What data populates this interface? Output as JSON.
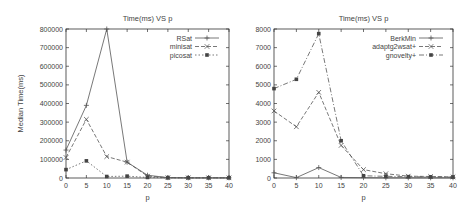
{
  "chart_data": [
    {
      "type": "line",
      "title": "Time(ms) VS p",
      "xlabel": "p",
      "ylabel": "Median Time(ms)",
      "x": [
        0,
        5,
        10,
        15,
        20,
        25,
        30,
        35,
        40
      ],
      "xticks": [
        0,
        5,
        10,
        15,
        20,
        25,
        30,
        35,
        40
      ],
      "yticks": [
        0,
        100000,
        200000,
        300000,
        400000,
        500000,
        600000,
        700000,
        800000
      ],
      "xlim": [
        0,
        40
      ],
      "ylim": [
        0,
        800000
      ],
      "grid": false,
      "legend_position": "top-right",
      "series": [
        {
          "name": "RSat",
          "marker": "+",
          "dash": "solid",
          "values": [
            150000,
            390000,
            800000,
            85000,
            15000,
            2000,
            1000,
            1000,
            1000
          ]
        },
        {
          "name": "minisat",
          "marker": "x",
          "dash": "dashed",
          "values": [
            110000,
            315000,
            115000,
            85000,
            10000,
            2000,
            1000,
            1000,
            1000
          ]
        },
        {
          "name": "picosat",
          "marker": "square",
          "dash": "dotted",
          "values": [
            45000,
            92000,
            8000,
            10000,
            3000,
            1000,
            1000,
            1000,
            1000
          ]
        }
      ]
    },
    {
      "type": "line",
      "title": "Time(ms) VS p",
      "xlabel": "p",
      "ylabel": "",
      "x": [
        0,
        5,
        10,
        15,
        20,
        25,
        30,
        35,
        40
      ],
      "xticks": [
        0,
        5,
        10,
        15,
        20,
        25,
        30,
        35,
        40
      ],
      "yticks": [
        0,
        1000,
        2000,
        3000,
        4000,
        5000,
        6000,
        7000,
        8000
      ],
      "xlim": [
        0,
        40
      ],
      "ylim": [
        0,
        8000
      ],
      "grid": false,
      "legend_position": "top-right",
      "series": [
        {
          "name": "BerkMin",
          "marker": "+",
          "dash": "solid",
          "values": [
            280,
            20,
            560,
            30,
            20,
            10,
            10,
            10,
            10
          ]
        },
        {
          "name": "adaptg2wsat+",
          "marker": "x",
          "dash": "dashed",
          "values": [
            3600,
            2750,
            4600,
            1750,
            450,
            230,
            100,
            80,
            60
          ]
        },
        {
          "name": "gnovelty+",
          "marker": "square",
          "dash": "dashdot",
          "values": [
            4800,
            5300,
            7750,
            2000,
            120,
            90,
            70,
            60,
            50
          ]
        }
      ]
    }
  ]
}
